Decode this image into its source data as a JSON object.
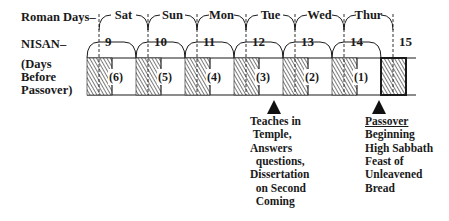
{
  "labels": {
    "roman_days": "Roman Days–",
    "nisan": "NISAN–",
    "days_before": [
      "(Days",
      " Before",
      "Passover)"
    ]
  },
  "roman_days": [
    "Sat",
    "Sun",
    "Mon",
    "Tue",
    "Wed",
    "Thur"
  ],
  "nisan_days": [
    "9",
    "10",
    "11",
    "12",
    "13",
    "14",
    "15"
  ],
  "days_before_passover": [
    "(6)",
    "(5)",
    "(4)",
    "(3)",
    "(2)",
    "(1)",
    ""
  ],
  "annotations": [
    {
      "day": "12",
      "lines": [
        "Teaches in",
        " Temple,",
        "Answers",
        "  questions,",
        "Dissertation",
        "  on Second",
        "  Coming"
      ]
    },
    {
      "day": "15",
      "title": "Passover",
      "lines": [
        "Beginning",
        "High Sabbath",
        "Feast of",
        "Unleavened",
        "Bread"
      ]
    }
  ],
  "colors": {
    "ink": "#1a1a1a",
    "hatch": "#555555",
    "background": "#ffffff"
  }
}
